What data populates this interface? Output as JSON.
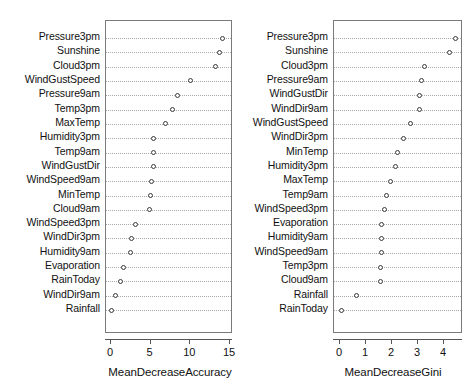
{
  "chart_data": [
    {
      "type": "scatter",
      "panel": "left",
      "title": "",
      "xlabel": "MeanDecreaseAccuracy",
      "ylabel": "",
      "xlim": [
        -0.35,
        15.5
      ],
      "xticks": [
        0,
        5,
        10,
        15
      ],
      "xticklabels": [
        "0",
        "5",
        "10",
        "15"
      ],
      "grid": true,
      "categories": [
        "Pressure3pm",
        "Sunshine",
        "Cloud3pm",
        "WindGustSpeed",
        "Pressure9am",
        "Temp3pm",
        "MaxTemp",
        "Humidity3pm",
        "Temp9am",
        "WindGustDir",
        "WindSpeed9am",
        "MinTemp",
        "Cloud9am",
        "WindSpeed3pm",
        "WindDir3pm",
        "Humidity9am",
        "Evaporation",
        "RainToday",
        "WindDir9am",
        "Rainfall"
      ],
      "values": [
        14.1,
        13.7,
        13.2,
        10.0,
        8.4,
        7.7,
        6.9,
        5.4,
        5.3,
        5.3,
        5.1,
        5.0,
        4.9,
        3.1,
        2.6,
        2.4,
        1.6,
        1.2,
        0.6,
        0.0
      ]
    },
    {
      "type": "scatter",
      "panel": "right",
      "title": "",
      "xlabel": "MeanDecreaseGini",
      "ylabel": "",
      "xlim": [
        -0.07,
        4.65
      ],
      "xticks": [
        0,
        1,
        2,
        3,
        4
      ],
      "xticklabels": [
        "0",
        "1",
        "2",
        "3",
        "4"
      ],
      "grid": true,
      "categories": [
        "Pressure3pm",
        "Sunshine",
        "Cloud3pm",
        "Pressure9am",
        "WindGustDir",
        "WindDir9am",
        "WindGustSpeed",
        "WindDir3pm",
        "MinTemp",
        "Humidity3pm",
        "MaxTemp",
        "Temp9am",
        "WindSpeed3pm",
        "Evaporation",
        "Humidity9am",
        "WindSpeed9am",
        "Temp3pm",
        "Cloud9am",
        "Rainfall",
        "RainToday"
      ],
      "values": [
        4.45,
        4.2,
        3.25,
        3.15,
        3.05,
        3.05,
        2.7,
        2.45,
        2.2,
        2.15,
        1.95,
        1.8,
        1.7,
        1.6,
        1.6,
        1.6,
        1.55,
        1.55,
        0.65,
        0.05
      ]
    }
  ],
  "axis_titles": {
    "left": "MeanDecreaseAccuracy",
    "right": "MeanDecreaseGini"
  }
}
